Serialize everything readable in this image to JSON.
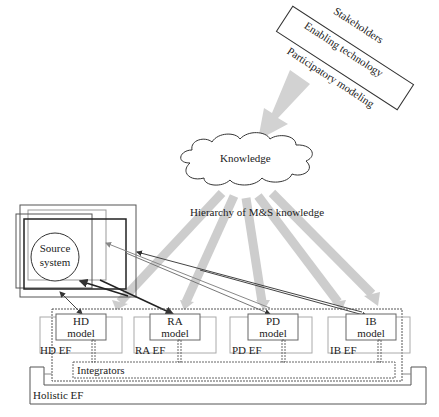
{
  "stakeholders_box": {
    "lines": [
      "Stakeholders",
      "Enabling technology",
      "Participatory modeling"
    ]
  },
  "knowledge_cloud": {
    "label": "Knowledge"
  },
  "hierarchy_label": "Hierarchy of M&S knowledge",
  "source_system": {
    "label_line1": "Source",
    "label_line2": "system"
  },
  "frameworks": [
    {
      "model_line1": "HD",
      "model_line2": "model",
      "ef_label": "HD EF"
    },
    {
      "model_line1": "RA",
      "model_line2": "model",
      "ef_label": "RA EF"
    },
    {
      "model_line1": "PD",
      "model_line2": "model",
      "ef_label": "PD EF"
    },
    {
      "model_line1": "IB",
      "model_line2": "model",
      "ef_label": "IB EF"
    }
  ],
  "integrators_label": "Integrators",
  "holistic_label": "Holistic EF",
  "colors": {
    "line": "#333333",
    "light_line": "#999999",
    "gray_arrow": "#cfcfcf"
  }
}
